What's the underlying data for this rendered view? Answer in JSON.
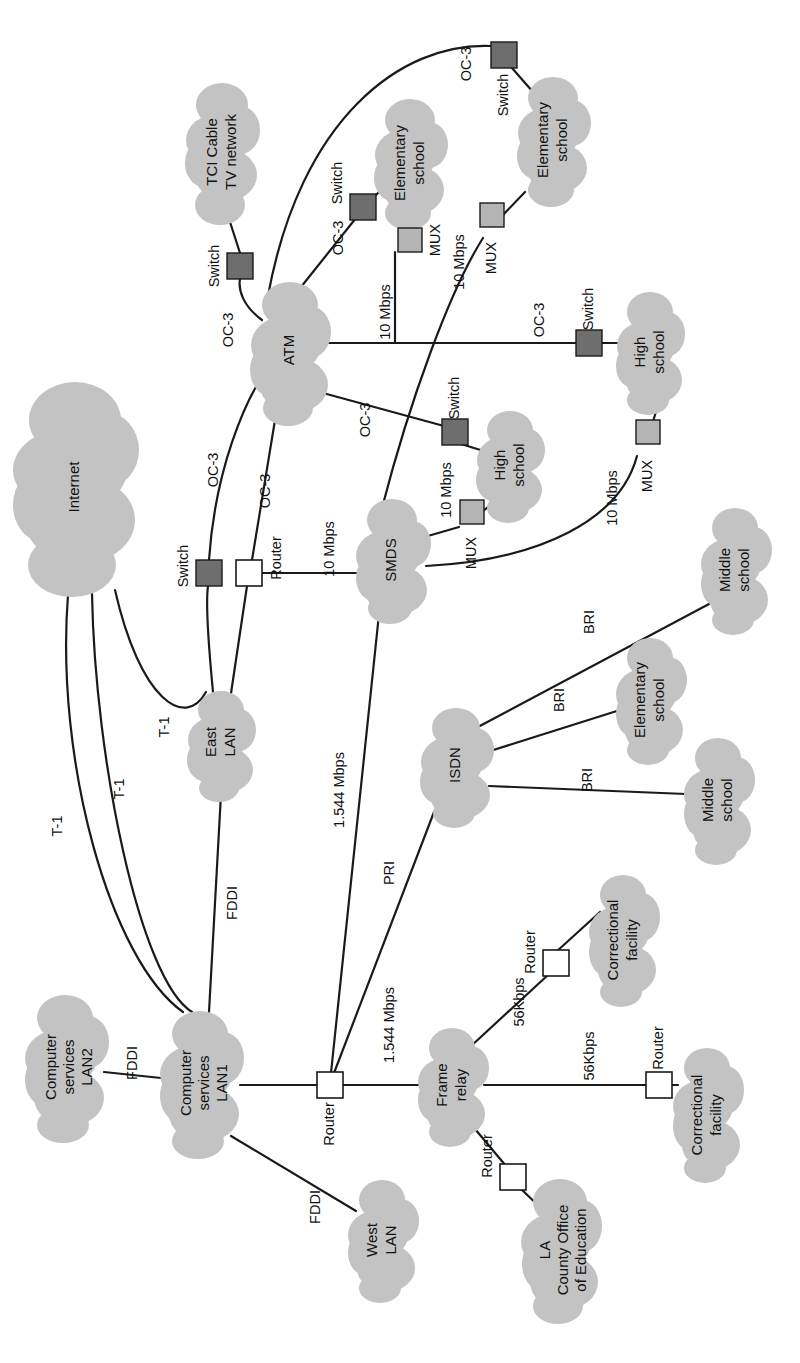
{
  "diagram": {
    "orientation": "rotated-90-ccw",
    "colors": {
      "cloud_fill": "#c3c3c3",
      "switch_fill": "#6e6e6e",
      "mux_fill": "#b4b4b4",
      "router_fill": "#ffffff",
      "line": "#1a1a1a",
      "background": "#ffffff"
    },
    "clouds": [
      {
        "id": "internet",
        "label": "Internet",
        "lines": [
          "Internet"
        ],
        "cx": 75,
        "cy": 487,
        "rx": 60,
        "ry": 108
      },
      {
        "id": "tci",
        "label": "TCI Cable TV network",
        "lines": [
          "TCI Cable",
          "TV network"
        ],
        "cx": 222,
        "cy": 152,
        "rx": 34,
        "ry": 72
      },
      {
        "id": "atm",
        "label": "ATM",
        "lines": [
          "ATM"
        ],
        "cx": 290,
        "cy": 350,
        "rx": 37,
        "ry": 62
      },
      {
        "id": "elem1",
        "label": "Elementary school",
        "lines": [
          "Elementary",
          "school"
        ],
        "cx": 410,
        "cy": 163,
        "rx": 34,
        "ry": 62
      },
      {
        "id": "elem2",
        "label": "Elementary school",
        "lines": [
          "Elementary",
          "school"
        ],
        "cx": 553,
        "cy": 140,
        "rx": 34,
        "ry": 62
      },
      {
        "id": "high1",
        "label": "High school",
        "lines": [
          "High",
          "school"
        ],
        "cx": 510,
        "cy": 465,
        "rx": 32,
        "ry": 52
      },
      {
        "id": "high2",
        "label": "High school",
        "lines": [
          "High",
          "school"
        ],
        "cx": 650,
        "cy": 352,
        "rx": 32,
        "ry": 56
      },
      {
        "id": "smds",
        "label": "SMDS",
        "lines": [
          "SMDS"
        ],
        "cx": 392,
        "cy": 560,
        "rx": 34,
        "ry": 56
      },
      {
        "id": "eastlan",
        "label": "East LAN",
        "lines": [
          "East",
          "LAN"
        ],
        "cx": 221,
        "cy": 742,
        "rx": 31,
        "ry": 52
      },
      {
        "id": "isdn",
        "label": "ISDN",
        "lines": [
          "ISDN"
        ],
        "cx": 456,
        "cy": 765,
        "rx": 33,
        "ry": 55
      },
      {
        "id": "middle1",
        "label": "Middle school",
        "lines": [
          "Middle",
          "school"
        ],
        "cx": 735,
        "cy": 570,
        "rx": 32,
        "ry": 58
      },
      {
        "id": "elem3",
        "label": "Elementary school",
        "lines": [
          "Elementary",
          "school"
        ],
        "cx": 650,
        "cy": 700,
        "rx": 32,
        "ry": 58
      },
      {
        "id": "middle2",
        "label": "Middle school",
        "lines": [
          "Middle",
          "school"
        ],
        "cx": 718,
        "cy": 800,
        "rx": 32,
        "ry": 58
      },
      {
        "id": "cslan2",
        "label": "Computer services LAN2",
        "lines": [
          "Computer",
          "services",
          "LAN2"
        ],
        "cx": 65,
        "cy": 1067,
        "rx": 40,
        "ry": 72
      },
      {
        "id": "cslan1",
        "label": "Computer services LAN1",
        "lines": [
          "Computer",
          "services",
          "LAN1"
        ],
        "cx": 200,
        "cy": 1083,
        "rx": 40,
        "ry": 72
      },
      {
        "id": "westlan",
        "label": "West LAN",
        "lines": [
          "West",
          "LAN"
        ],
        "cx": 382,
        "cy": 1240,
        "rx": 31,
        "ry": 56
      },
      {
        "id": "framerelay",
        "label": "Frame relay",
        "lines": [
          "Frame",
          "relay"
        ],
        "cx": 452,
        "cy": 1085,
        "rx": 32,
        "ry": 54
      },
      {
        "id": "correct1",
        "label": "Correctional facility",
        "lines": [
          "Correctional",
          "facility"
        ],
        "cx": 623,
        "cy": 940,
        "rx": 32,
        "ry": 62
      },
      {
        "id": "correct2",
        "label": "Correctional facility",
        "lines": [
          "Correctional",
          "facility"
        ],
        "cx": 707,
        "cy": 1115,
        "rx": 32,
        "ry": 64
      },
      {
        "id": "lacoe",
        "label": "LA County Office of Education",
        "lines": [
          "LA",
          "County Office",
          "of Education"
        ],
        "cx": 560,
        "cy": 1250,
        "rx": 42,
        "ry": 70
      }
    ],
    "devices": [
      {
        "id": "sw-tci",
        "type": "switch",
        "label": "Switch",
        "x": 240,
        "y": 266,
        "lx": 215,
        "ly": 266
      },
      {
        "id": "sw-elem1",
        "type": "switch",
        "label": "Switch",
        "x": 363,
        "y": 207,
        "lx": 340,
        "ly": 185
      },
      {
        "id": "sw-elem2",
        "type": "switch",
        "label": "Switch",
        "x": 504,
        "y": 55,
        "lx": 504,
        "ly": 95
      },
      {
        "id": "sw-high2",
        "type": "switch",
        "label": "Switch",
        "x": 589,
        "y": 343,
        "lx": 589,
        "ly": 313
      },
      {
        "id": "sw-high1",
        "type": "switch",
        "label": "Switch",
        "x": 455,
        "y": 432,
        "lx": 437,
        "ly": 408
      },
      {
        "id": "sw-east",
        "type": "switch",
        "label": "Switch",
        "x": 211,
        "y": 573,
        "lx": 186,
        "ly": 567
      },
      {
        "id": "mux-elem1",
        "type": "mux",
        "label": "MUX",
        "x": 410,
        "y": 240,
        "lx": 437,
        "ly": 243
      },
      {
        "id": "mux-elem2",
        "type": "mux",
        "label": "MUX",
        "x": 492,
        "y": 226,
        "lx": 492,
        "ly": 262
      },
      {
        "id": "mux-high2",
        "type": "mux",
        "label": "MUX",
        "x": 646,
        "y": 444,
        "lx": 646,
        "ly": 478
      },
      {
        "id": "mux-high1",
        "type": "mux",
        "label": "MUX",
        "x": 470,
        "y": 519,
        "lx": 470,
        "ly": 553
      },
      {
        "id": "rt-east",
        "type": "router",
        "label": "Router",
        "x": 249,
        "y": 573,
        "lx": 277,
        "ly": 560
      },
      {
        "id": "rt-core",
        "type": "router",
        "label": "Router",
        "x": 330,
        "y": 1085,
        "lx": 330,
        "ly": 1120
      },
      {
        "id": "rt-cor1",
        "type": "router",
        "label": "Router",
        "x": 556,
        "y": 963,
        "lx": 534,
        "ly": 955
      },
      {
        "id": "rt-cor2",
        "type": "router",
        "label": "Router",
        "x": 659,
        "y": 1085,
        "lx": 659,
        "ly": 1053
      },
      {
        "id": "rt-lacoe",
        "type": "router",
        "label": "Router",
        "x": 513,
        "y": 1177,
        "lx": 490,
        "ly": 1158
      }
    ],
    "links": [
      {
        "id": "l-tci-atm",
        "label": "OC-3",
        "lx": 229,
        "ly": 330
      },
      {
        "id": "l-atm-swelem1",
        "label": "OC-3",
        "lx": 339,
        "ly": 238
      },
      {
        "id": "l-atm-swelem2",
        "label": "OC-3",
        "lx": 467,
        "ly": 64
      },
      {
        "id": "l-atm-high2",
        "label": "OC-3",
        "lx": 540,
        "ly": 320
      },
      {
        "id": "l-atm-swhigh1",
        "label": "OC-3",
        "lx": 366,
        "ly": 420
      },
      {
        "id": "l-atm-sweast",
        "label": "OC-3",
        "lx": 214,
        "ly": 470
      },
      {
        "id": "l-atm-rteast",
        "label": "OC-3",
        "lx": 266,
        "ly": 491
      },
      {
        "id": "l-atm-muxelem1",
        "label": "10 Mbps",
        "lx": 386,
        "ly": 312
      },
      {
        "id": "l-smds-muxelem2",
        "label": "10 Mbps",
        "lx": 460,
        "ly": 262
      },
      {
        "id": "l-smds-muxhigh1",
        "label": "10 Mbps",
        "lx": 447,
        "ly": 490
      },
      {
        "id": "l-smds-muxhigh2",
        "label": "10 Mbps",
        "lx": 613,
        "ly": 498
      },
      {
        "id": "l-rteast-smds",
        "label": "10 Mbps",
        "lx": 330,
        "ly": 549
      },
      {
        "id": "l-rtcore-smds",
        "label": "1.544 Mbps",
        "lx": 340,
        "ly": 790
      },
      {
        "id": "l-rtcore-isdn",
        "label": "PRI",
        "lx": 390,
        "ly": 873
      },
      {
        "id": "l-rtcore-frame",
        "label": "1.544 Mbps",
        "lx": 390,
        "ly": 1025
      },
      {
        "id": "l-isdn-middle1",
        "label": "BRI",
        "lx": 590,
        "ly": 622
      },
      {
        "id": "l-isdn-elem3",
        "label": "BRI",
        "lx": 560,
        "ly": 700
      },
      {
        "id": "l-isdn-middle2",
        "label": "BRI",
        "lx": 588,
        "ly": 780
      },
      {
        "id": "l-internet-t1a",
        "label": "T-1",
        "lx": 58,
        "ly": 826
      },
      {
        "id": "l-internet-t1b",
        "label": "T-1",
        "lx": 120,
        "ly": 789
      },
      {
        "id": "l-internet-t1c",
        "label": "T-1",
        "lx": 165,
        "ly": 727
      },
      {
        "id": "l-cslan1-east",
        "label": "FDDI",
        "lx": 233,
        "ly": 903
      },
      {
        "id": "l-cslan2-cslan1",
        "label": "FDDI",
        "lx": 133,
        "ly": 1063
      },
      {
        "id": "l-cslan1-west",
        "label": "FDDI",
        "lx": 316,
        "ly": 1207
      },
      {
        "id": "l-frame-rtcor1",
        "label": "56Kbps",
        "lx": 520,
        "ly": 1002
      },
      {
        "id": "l-frame-rtcor2",
        "label": "56Kbps",
        "lx": 590,
        "ly": 1056
      }
    ]
  }
}
